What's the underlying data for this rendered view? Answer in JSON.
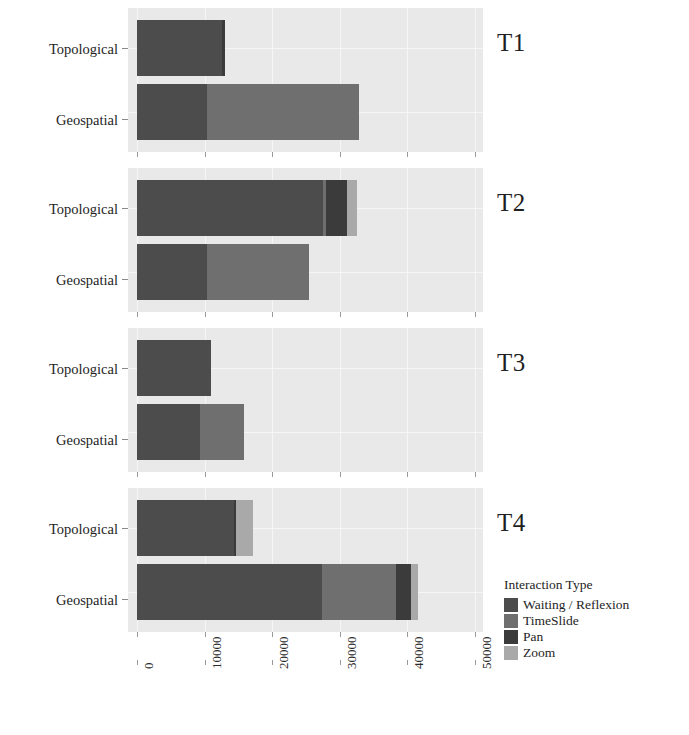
{
  "chart_data": {
    "type": "bar",
    "subtype": "stacked-horizontal-faceted",
    "title": "",
    "xlabel": "",
    "ylabel": "",
    "xlim": [
      0,
      50000
    ],
    "xticks": [
      0,
      10000,
      20000,
      30000,
      40000,
      50000
    ],
    "xticklabels": [
      "0",
      "10000",
      "20000",
      "30000",
      "40000",
      "50000"
    ],
    "categories": [
      "Topological",
      "Geospatial"
    ],
    "grid": true,
    "legend": {
      "title": "Interaction Type",
      "position": "bottom-right",
      "entries": [
        {
          "name": "Waiting / Reflexion",
          "color": "#4c4c4c"
        },
        {
          "name": "TimeSlide",
          "color": "#6f6f6f"
        },
        {
          "name": "Pan",
          "color": "#3b3b3b"
        },
        {
          "name": "Zoom",
          "color": "#a9a9a9"
        }
      ]
    },
    "facets": [
      {
        "label": "T1",
        "rows": [
          {
            "category": "Topological",
            "segments": [
              {
                "name": "Waiting / Reflexion",
                "value": 12600
              },
              {
                "name": "TimeSlide",
                "value": 0
              },
              {
                "name": "Pan",
                "value": 400
              },
              {
                "name": "Zoom",
                "value": 0
              }
            ],
            "total": 13000
          },
          {
            "category": "Geospatial",
            "segments": [
              {
                "name": "Waiting / Reflexion",
                "value": 10300
              },
              {
                "name": "TimeSlide",
                "value": 22500
              },
              {
                "name": "Pan",
                "value": 0
              },
              {
                "name": "Zoom",
                "value": 0
              }
            ],
            "total": 32800
          }
        ]
      },
      {
        "label": "T2",
        "rows": [
          {
            "category": "Topological",
            "segments": [
              {
                "name": "Waiting / Reflexion",
                "value": 27500
              },
              {
                "name": "TimeSlide",
                "value": 400
              },
              {
                "name": "Pan",
                "value": 3200
              },
              {
                "name": "Zoom",
                "value": 1400
              }
            ],
            "total": 32500
          },
          {
            "category": "Geospatial",
            "segments": [
              {
                "name": "Waiting / Reflexion",
                "value": 10300
              },
              {
                "name": "TimeSlide",
                "value": 15200
              },
              {
                "name": "Pan",
                "value": 0
              },
              {
                "name": "Zoom",
                "value": 0
              }
            ],
            "total": 25500
          }
        ]
      },
      {
        "label": "T3",
        "rows": [
          {
            "category": "Topological",
            "segments": [
              {
                "name": "Waiting / Reflexion",
                "value": 10900
              },
              {
                "name": "TimeSlide",
                "value": 0
              },
              {
                "name": "Pan",
                "value": 0
              },
              {
                "name": "Zoom",
                "value": 0
              }
            ],
            "total": 10900
          },
          {
            "category": "Geospatial",
            "segments": [
              {
                "name": "Waiting / Reflexion",
                "value": 9300
              },
              {
                "name": "TimeSlide",
                "value": 6600
              },
              {
                "name": "Pan",
                "value": 0
              },
              {
                "name": "Zoom",
                "value": 0
              }
            ],
            "total": 15900
          }
        ]
      },
      {
        "label": "T4",
        "rows": [
          {
            "category": "Topological",
            "segments": [
              {
                "name": "Waiting / Reflexion",
                "value": 14400
              },
              {
                "name": "TimeSlide",
                "value": 0
              },
              {
                "name": "Pan",
                "value": 300
              },
              {
                "name": "Zoom",
                "value": 2500
              }
            ],
            "total": 17200
          },
          {
            "category": "Geospatial",
            "segments": [
              {
                "name": "Waiting / Reflexion",
                "value": 27400
              },
              {
                "name": "TimeSlide",
                "value": 10900
              },
              {
                "name": "Pan",
                "value": 2200
              },
              {
                "name": "Zoom",
                "value": 1100
              }
            ],
            "total": 41600
          }
        ]
      }
    ]
  }
}
